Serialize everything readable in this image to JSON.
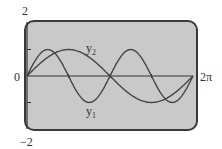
{
  "chart_data": {
    "type": "line",
    "title": "",
    "xlabel": "",
    "ylabel": "",
    "xlim": [
      0,
      6.2832
    ],
    "ylim": [
      -2,
      2
    ],
    "x_tick_labels": [
      "0",
      "2π"
    ],
    "y_tick_labels": [
      "2",
      "-2"
    ],
    "y_ticks": [
      -1,
      1
    ],
    "x_ticks": [
      1.5708,
      3.1416,
      4.7124
    ],
    "grid": false,
    "series": [
      {
        "name": "y1",
        "formula": "sin(2x)",
        "x": [
          0,
          0.785,
          1.571,
          2.356,
          3.142,
          3.927,
          4.712,
          5.498,
          6.283
        ],
        "values": [
          0,
          1,
          0,
          -1,
          0,
          1,
          0,
          -1,
          0
        ]
      },
      {
        "name": "y2",
        "formula": "sin(x)",
        "x": [
          0,
          1.571,
          3.142,
          4.712,
          6.283
        ],
        "values": [
          0,
          1,
          0,
          -1,
          0
        ]
      }
    ]
  },
  "labels": {
    "ymax": "2",
    "ymin": "−2",
    "origin": "0",
    "xmax": "2π",
    "y1": "y",
    "y1_sub": "1",
    "y2": "y",
    "y2_sub": "2"
  }
}
